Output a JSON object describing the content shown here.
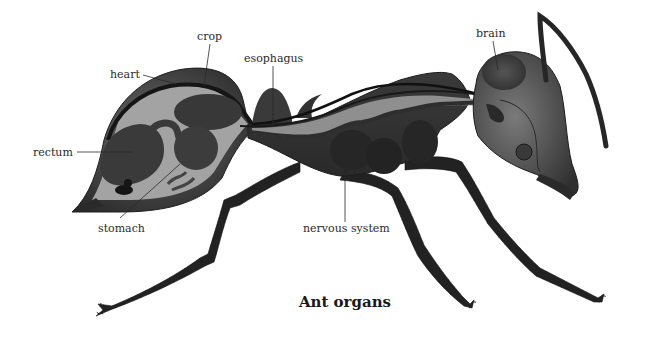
{
  "title": "Ant organs",
  "labels": {
    "crop": "crop",
    "heart": "heart",
    "esophagus": "esophagus",
    "brain": "brain",
    "rectum": "rectum",
    "stomach": "stomach",
    "nervous_system": "nervous system"
  },
  "colors": {
    "background": "#ffffff",
    "exoskeleton_dark": "#2b2b2b",
    "exoskeleton_mid": "#4a4a4a",
    "body_cavity_light": "#9a9a9a",
    "organ_dark": "#3a3a3a",
    "label_text": "#2a2a2a"
  }
}
